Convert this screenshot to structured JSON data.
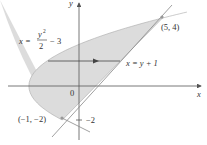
{
  "diagram": {
    "type": "region-between-curves",
    "axes": {
      "x_label": "x",
      "y_label": "y",
      "origin_label": "0"
    },
    "curves": [
      {
        "name": "parabola",
        "equation_lhs": "x =",
        "numerator": "y",
        "exponent": "2",
        "denominator": "2",
        "tail": "− 3"
      },
      {
        "name": "line",
        "equation": "x = y + 1"
      }
    ],
    "points": [
      {
        "label": "(5, 4)",
        "x": 5,
        "y": 4
      },
      {
        "label": "(−1, −2)",
        "x": -1,
        "y": -2
      }
    ],
    "tick_labels": [
      {
        "label": "−2",
        "y": -2
      }
    ],
    "colors": {
      "region_fill": "#d9d9d9",
      "line": "#888888",
      "axis": "#555555",
      "text": "#333333",
      "point": "#999999"
    }
  }
}
